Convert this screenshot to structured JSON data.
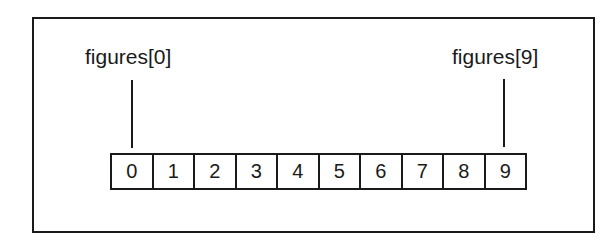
{
  "diagram": {
    "title": "",
    "array_name": "figures",
    "labels": {
      "first": "figures[0]",
      "last": "figures[9]"
    },
    "cells": [
      "0",
      "1",
      "2",
      "3",
      "4",
      "5",
      "6",
      "7",
      "8",
      "9"
    ],
    "colors": {
      "stroke": "#1a1a1a",
      "background": "#ffffff"
    }
  }
}
